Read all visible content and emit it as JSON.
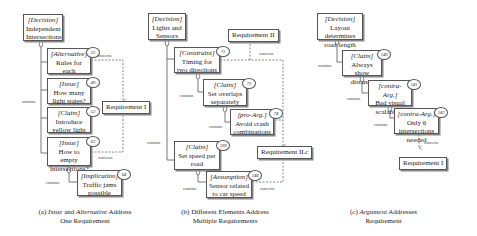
{
  "panels": [
    {
      "id": "a",
      "caption": {
        "prefix": "(a) ",
        "italic1": "Issue",
        "mid": " and ",
        "italic2": "Alternative",
        "rest": " Address",
        "line2": "One Requirement"
      },
      "decision": {
        "tag": "[Decision]",
        "text": "Independent Intersections"
      },
      "elements": [
        {
          "tag": "[Alternative]",
          "text": "Rules for each intersection",
          "num": "22"
        },
        {
          "tag": "[Issue]",
          "text": "How many light states?",
          "num": "49"
        },
        {
          "tag": "[Claim]",
          "text": "Introduce yellow light",
          "num": "52"
        },
        {
          "tag": "[Issue]",
          "text": "How to empty intersections?",
          "num": "63"
        },
        {
          "tag": "[Implication]",
          "text": "Traffic jams possible",
          "num": "64"
        }
      ],
      "requirements": [
        "Requirement I"
      ],
      "labels": {
        "contains": "contains",
        "concerns": "concerns"
      }
    },
    {
      "id": "b",
      "caption": {
        "prefix": "(b) Different Elements Address",
        "line2": "Multiple Requirements"
      },
      "decision": {
        "tag": "[Decision]",
        "text": "Lights and Sensors"
      },
      "elements": [
        {
          "tag": "[Constraint]",
          "text": "Timing for two directions",
          "num": "71"
        },
        {
          "tag": "[Claim]",
          "text": "Set overlaps separately",
          "num": "73"
        },
        {
          "tag": "[pro-Arg.]",
          "text": "Avoid crash combinations",
          "num": "74"
        },
        {
          "tag": "[Claim]",
          "text": "Set speed per road",
          "num": "109"
        },
        {
          "tag": "[Assumption]",
          "text": "Sensor related to car speed",
          "num": "148"
        }
      ],
      "requirements": [
        "Requirement II",
        "Requirement II.c"
      ],
      "labels": {
        "contains": "contains",
        "concerns": "concerns"
      }
    },
    {
      "id": "c",
      "caption": {
        "prefix": "(c) ",
        "italic1": "Argument",
        "rest": " Addresses",
        "line2": "Requirement"
      },
      "decision": {
        "tag": "[Decision]",
        "text": "Layout determines road length"
      },
      "elements": [
        {
          "tag": "[Claim]",
          "text": "Always show distance",
          "num": "140"
        },
        {
          "tag": "[contra-Arg.]",
          "text": "Bad visual scalability",
          "num": "141"
        },
        {
          "tag": "[contra-Arg.]",
          "text": "Only 6 intersections needed",
          "num": "142"
        }
      ],
      "requirements": [
        "Requirement I"
      ],
      "labels": {
        "contains": "contains",
        "concerns": "concerns"
      }
    }
  ]
}
